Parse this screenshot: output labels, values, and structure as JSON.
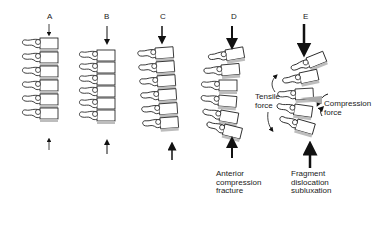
{
  "panels": [
    {
      "id": "A",
      "letter": "A",
      "force": "minimal"
    },
    {
      "id": "B",
      "letter": "B",
      "force": "mild"
    },
    {
      "id": "C",
      "letter": "C",
      "force": "moderate"
    },
    {
      "id": "D",
      "letter": "D",
      "force": "strong",
      "caption": [
        "Anterior",
        "compression",
        "fracture"
      ]
    },
    {
      "id": "E",
      "letter": "E",
      "force": "severe",
      "caption": [
        "Fragment",
        "dislocation",
        "subluxation"
      ]
    }
  ],
  "annotations": {
    "tensile": [
      "Tensile",
      "force"
    ],
    "compression": [
      "Compression",
      "force"
    ]
  },
  "colors": {
    "ink": "#1a1a1a",
    "disc_fill": "#bdbdbd",
    "background": "#ffffff"
  }
}
